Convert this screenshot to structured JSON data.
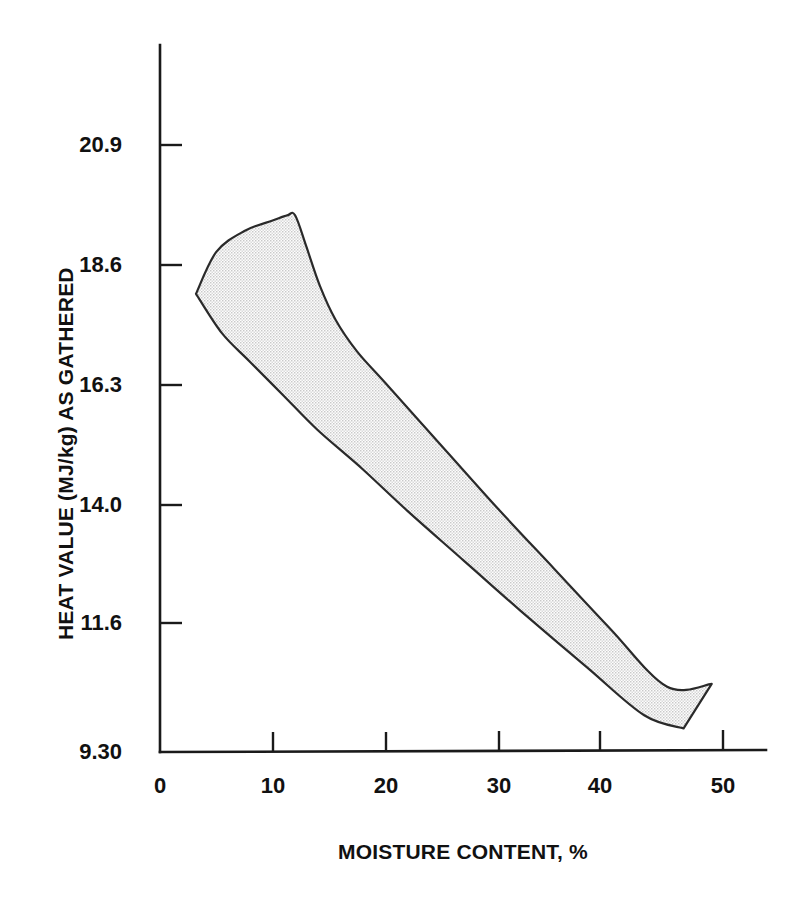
{
  "chart_data": {
    "type": "area",
    "title": "",
    "subtitle": "",
    "xlabel": "MOISTURE CONTENT, %",
    "ylabel": "HEAT VALUE (MJ/kg) AS GATHERED",
    "xlim": [
      0,
      54
    ],
    "ylim": [
      9.3,
      22.0
    ],
    "grid": false,
    "legend": null,
    "annotations": [],
    "x_ticks": [
      {
        "value": 0,
        "label": "0"
      },
      {
        "value": 10,
        "label": "10"
      },
      {
        "value": 20,
        "label": "20"
      },
      {
        "value": 30,
        "label": "30"
      },
      {
        "value": 40,
        "label": "40"
      },
      {
        "value": 50,
        "label": "50"
      }
    ],
    "y_ticks": [
      {
        "value": 20.9,
        "label": "20.9"
      },
      {
        "value": 18.6,
        "label": "18.6"
      },
      {
        "value": 16.3,
        "label": "16.3"
      },
      {
        "value": 14.0,
        "label": "14.0"
      },
      {
        "value": 11.6,
        "label": "11.6"
      },
      {
        "value": 9.3,
        "label": "9.30"
      }
    ],
    "series": [
      {
        "name": "Heat value range band",
        "fill": "#ececec",
        "outline": "#2a2a2a",
        "upper_bound": [
          {
            "x": 3.2,
            "y": 18.05
          },
          {
            "x": 5.0,
            "y": 18.85
          },
          {
            "x": 7.5,
            "y": 19.25
          },
          {
            "x": 10.0,
            "y": 19.45
          },
          {
            "x": 11.3,
            "y": 19.55
          },
          {
            "x": 12.0,
            "y": 19.55
          },
          {
            "x": 13.0,
            "y": 18.95
          },
          {
            "x": 14.2,
            "y": 18.2
          },
          {
            "x": 15.6,
            "y": 17.55
          },
          {
            "x": 17.5,
            "y": 16.95
          },
          {
            "x": 20.0,
            "y": 16.35
          },
          {
            "x": 25.0,
            "y": 15.15
          },
          {
            "x": 30.0,
            "y": 13.95
          },
          {
            "x": 35.0,
            "y": 12.8
          },
          {
            "x": 40.0,
            "y": 11.65
          },
          {
            "x": 45.0,
            "y": 10.55
          },
          {
            "x": 49.0,
            "y": 10.6
          }
        ],
        "lower_bound": [
          {
            "x": 3.2,
            "y": 18.05
          },
          {
            "x": 5.5,
            "y": 17.3
          },
          {
            "x": 8.0,
            "y": 16.75
          },
          {
            "x": 11.0,
            "y": 16.1
          },
          {
            "x": 14.0,
            "y": 15.45
          },
          {
            "x": 18.0,
            "y": 14.7
          },
          {
            "x": 22.0,
            "y": 13.9
          },
          {
            "x": 27.0,
            "y": 12.95
          },
          {
            "x": 32.0,
            "y": 12.0
          },
          {
            "x": 38.0,
            "y": 10.9
          },
          {
            "x": 43.0,
            "y": 10.0
          },
          {
            "x": 46.5,
            "y": 9.75
          }
        ]
      }
    ]
  },
  "axes": {
    "y_title": "HEAT VALUE (MJ/kg) AS GATHERED",
    "x_title": "MOISTURE CONTENT, %",
    "y_tick_labels": [
      "20.9",
      "18.6",
      "16.3",
      "14.0",
      "11.6",
      "9.30"
    ],
    "x_tick_labels": [
      "0",
      "10",
      "20",
      "30",
      "40",
      "50"
    ]
  },
  "colors": {
    "background": "#ffffff",
    "ink": "#111111",
    "axis": "#1a1a1a",
    "band_fill": "#ececec",
    "band_outline": "#2a2a2a"
  }
}
